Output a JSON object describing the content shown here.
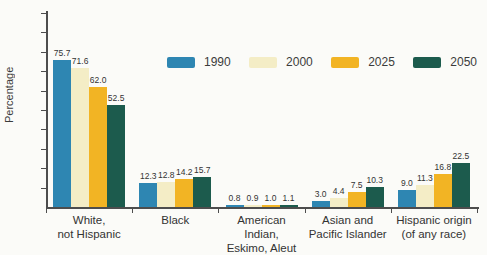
{
  "chart_data": {
    "type": "bar",
    "ylabel": "Percentage",
    "xlabel": "",
    "ylim": [
      0,
      100
    ],
    "yticks": [
      10,
      20,
      30,
      40,
      50,
      60,
      70,
      80,
      90,
      100
    ],
    "grid": false,
    "legend_position": "top-right-inside",
    "categories": [
      "White,\nnot Hispanic",
      "Black",
      "American Indian,\nEskimo, Aleut",
      "Asian and\nPacific Islander",
      "Hispanic origin\n(of any race)"
    ],
    "series": [
      {
        "name": "1990",
        "color": "#2E86B2",
        "values": [
          75.7,
          12.3,
          0.8,
          3.0,
          9.0
        ]
      },
      {
        "name": "2000",
        "color": "#F4EDC6",
        "values": [
          71.6,
          12.8,
          0.9,
          4.4,
          11.3
        ]
      },
      {
        "name": "2025",
        "color": "#F2B424",
        "values": [
          62.0,
          14.2,
          1.0,
          7.5,
          16.8
        ]
      },
      {
        "name": "2050",
        "color": "#1C5B4D",
        "values": [
          52.5,
          15.7,
          1.1,
          10.3,
          22.5
        ]
      }
    ],
    "colors": {
      "axis": "#4d4d4d",
      "text": "#3b3b3b",
      "background": "#fbfbf8"
    }
  }
}
